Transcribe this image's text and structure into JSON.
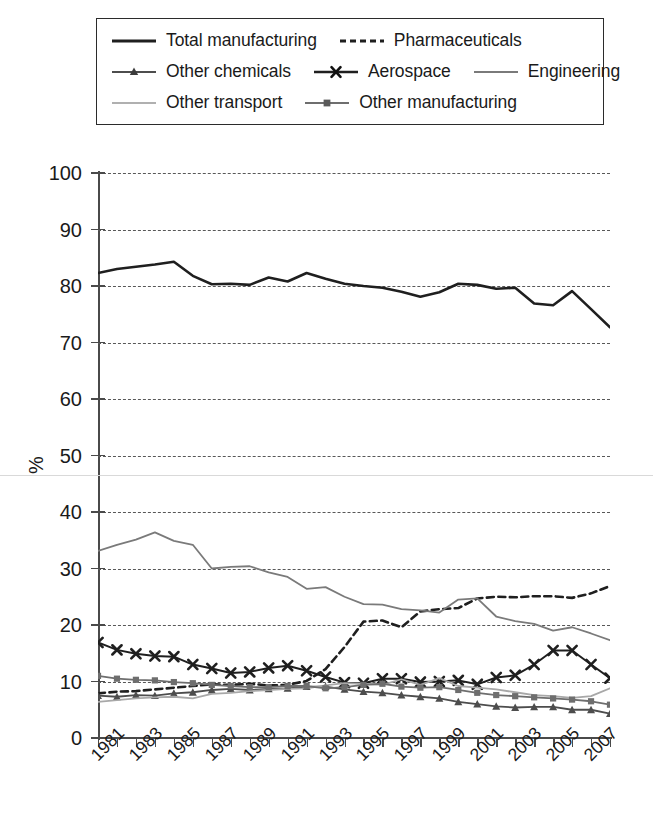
{
  "legend": {
    "rows": [
      [
        {
          "label": "Total manufacturing",
          "key": "total_manufacturing"
        },
        {
          "label": "Pharmaceuticals",
          "key": "pharmaceuticals"
        }
      ],
      [
        {
          "label": "Other chemicals",
          "key": "other_chemicals"
        },
        {
          "label": "Aerospace",
          "key": "aerospace"
        },
        {
          "label": "Engineering",
          "key": "engineering"
        }
      ],
      [
        {
          "label": "Other transport",
          "key": "other_transport"
        },
        {
          "label": "Other manufacturing",
          "key": "other_manufacturing"
        }
      ]
    ]
  },
  "axes": {
    "ylabel": "%",
    "ytick_labels": [
      "100",
      "90",
      "80",
      "70",
      "60",
      "50",
      "40",
      "30",
      "20",
      "10",
      "0"
    ],
    "xtick_labels": [
      "1981",
      "1983",
      "1985",
      "1987",
      "1989",
      "1991",
      "1993",
      "1995",
      "1997",
      "1999",
      "2001",
      "2003",
      "2005",
      "2007"
    ]
  },
  "chart_data": {
    "type": "line",
    "title": "",
    "xlabel": "",
    "ylabel": "%",
    "xlim": [
      1981,
      2008
    ],
    "ylim": [
      0,
      100
    ],
    "ytick_step": 10,
    "grid": true,
    "grid_style": "dashed-horizontal",
    "legend_position": "top",
    "x": [
      1981,
      1982,
      1983,
      1984,
      1985,
      1986,
      1987,
      1988,
      1989,
      1990,
      1991,
      1992,
      1993,
      1994,
      1995,
      1996,
      1997,
      1998,
      1999,
      2000,
      2001,
      2002,
      2003,
      2004,
      2005,
      2006,
      2007,
      2008
    ],
    "series": [
      {
        "name": "Total manufacturing",
        "color": "#1f1f1f",
        "linestyle": "solid",
        "linewidth": 2.6,
        "marker": "none",
        "values": [
          82.3,
          83.0,
          83.4,
          83.8,
          84.3,
          81.8,
          80.3,
          80.4,
          80.2,
          81.5,
          80.8,
          82.3,
          81.3,
          80.4,
          80.0,
          79.7,
          79.0,
          78.1,
          78.9,
          80.4,
          80.2,
          79.5,
          79.7,
          76.9,
          76.6,
          79.1,
          75.9,
          72.7
        ]
      },
      {
        "name": "Pharmaceuticals",
        "color": "#1f1f1f",
        "linestyle": "dashed",
        "linewidth": 2.6,
        "marker": "none",
        "values": [
          7.9,
          8.2,
          8.3,
          8.6,
          8.9,
          9.2,
          9.5,
          9.4,
          9.6,
          9.3,
          9.4,
          10.1,
          12.2,
          16.1,
          20.6,
          20.8,
          19.6,
          22.4,
          22.8,
          23.0,
          24.7,
          25.0,
          24.9,
          25.1,
          25.1,
          24.8,
          25.6,
          26.9
        ]
      },
      {
        "name": "Other chemicals",
        "color": "#4d4d4d",
        "linestyle": "solid",
        "linewidth": 1.8,
        "marker": "triangle",
        "values": [
          7.5,
          7.3,
          7.6,
          7.5,
          7.9,
          8.1,
          8.5,
          8.7,
          8.5,
          8.7,
          8.8,
          9.1,
          9.1,
          8.6,
          8.2,
          8.0,
          7.6,
          7.3,
          7.0,
          6.4,
          6.0,
          5.6,
          5.4,
          5.5,
          5.5,
          5.0,
          5.0,
          4.3
        ]
      },
      {
        "name": "Aerospace",
        "color": "#1f1f1f",
        "linestyle": "solid",
        "linewidth": 2.0,
        "marker": "x",
        "values": [
          16.9,
          15.6,
          14.9,
          14.5,
          14.4,
          13.0,
          12.3,
          11.5,
          11.7,
          12.4,
          12.8,
          11.9,
          10.8,
          9.8,
          9.7,
          10.5,
          10.5,
          9.9,
          10.0,
          10.2,
          9.5,
          10.7,
          11.1,
          13.0,
          15.5,
          15.5,
          13.0,
          10.6
        ]
      },
      {
        "name": "Engineering",
        "color": "#7a7a7a",
        "linestyle": "solid",
        "linewidth": 1.8,
        "marker": "none",
        "values": [
          33.1,
          34.2,
          35.1,
          36.4,
          34.9,
          34.2,
          30.0,
          30.3,
          30.4,
          29.3,
          28.5,
          26.4,
          26.7,
          25.0,
          23.7,
          23.6,
          22.8,
          22.6,
          22.2,
          24.5,
          24.7,
          21.5,
          20.7,
          20.2,
          19.0,
          19.6,
          18.5,
          17.3
        ]
      },
      {
        "name": "Other transport",
        "color": "#a8a8a8",
        "linestyle": "solid",
        "linewidth": 1.8,
        "marker": "none",
        "values": [
          6.4,
          6.7,
          7.0,
          7.2,
          7.3,
          7.0,
          7.8,
          8.0,
          8.3,
          8.5,
          8.7,
          8.8,
          9.3,
          9.7,
          9.6,
          9.4,
          10.4,
          9.4,
          10.6,
          9.2,
          8.9,
          8.6,
          8.1,
          7.6,
          7.4,
          7.1,
          7.4,
          8.8
        ]
      },
      {
        "name": "Other manufacturing",
        "color": "#6e6e6e",
        "linestyle": "solid",
        "linewidth": 1.8,
        "marker": "square",
        "values": [
          11.0,
          10.5,
          10.3,
          10.2,
          9.9,
          9.7,
          9.4,
          9.2,
          9.0,
          9.0,
          9.2,
          9.2,
          8.8,
          9.0,
          9.4,
          9.6,
          9.1,
          8.9,
          9.0,
          8.5,
          8.0,
          7.6,
          7.4,
          7.2,
          7.0,
          6.8,
          6.5,
          5.9
        ]
      }
    ]
  }
}
